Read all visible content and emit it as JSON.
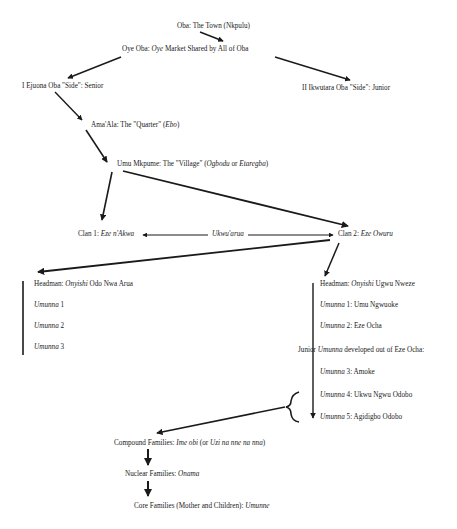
{
  "diagram": {
    "nodes": {
      "town": {
        "pre": "Oba: The Town (Nkpulu)"
      },
      "market": {
        "pre": "Oye Oba: ",
        "it": "Oye",
        "post": " Market Shared by All of Oba"
      },
      "side_senior": {
        "pre": "I Ejuona Oba \"Side\": Senior"
      },
      "side_junior": {
        "pre": "II Ikwutara Oba \"Side\": Junior"
      },
      "quarter": {
        "pre": "Ama'Ala: The \"Quarter\" (",
        "it": "Ebo",
        "post": ")"
      },
      "village": {
        "pre": "Umu Mkpume: The \"Village\" (",
        "it": "Ogbodu",
        "mid": " or ",
        "it2": "Etaregba",
        "post": ")"
      },
      "clan1": {
        "pre": "Clan 1: ",
        "it": "Eze n'Akwa"
      },
      "relation": {
        "it": "Ukwu'arua"
      },
      "clan2": {
        "pre": "Clan 2: ",
        "it": "Eze Owuru"
      },
      "left_headman": {
        "pre": "Headman: ",
        "it": "Onyishi",
        "post": " Odo Nwa Arua"
      },
      "left_u1": {
        "it": "Umunna",
        "post": " 1"
      },
      "left_u2": {
        "it": "Umunna",
        "post": " 2"
      },
      "left_u3": {
        "it": "Umunna",
        "post": " 3"
      },
      "right_headman": {
        "pre": "Headman: ",
        "it": "Onyishi",
        "post": " Ugwu Nweze"
      },
      "right_u1": {
        "it": "Umunna",
        "post": " 1: Umu Ngwuoke"
      },
      "right_u2": {
        "it": "Umunna",
        "post": " 2: Eze Ocha"
      },
      "junior": {
        "pre": "Junior ",
        "it": "Umunna",
        "post": " developed out of Eze Ocha:"
      },
      "right_u3": {
        "it": "Umunna",
        "post": " 3: Amoke"
      },
      "right_u4": {
        "it": "Umunna",
        "post": " 4: Ukwu Ngwu Odobo"
      },
      "right_u5": {
        "it": "Umunna",
        "post": " 5: Agidigbo Odobo"
      },
      "compound": {
        "pre": "Compound Families: ",
        "it": "Ime obi",
        "mid": " (or ",
        "it2": "Uzi na nne na nna",
        "post": ")"
      },
      "nuclear": {
        "pre": "Nuclear Families: ",
        "it": "Onama"
      },
      "core": {
        "pre": "Core Families (Mother and Children): ",
        "it": "Umunne"
      }
    },
    "colors": {
      "line": "#1a1a1a",
      "background": "#ffffff"
    }
  }
}
